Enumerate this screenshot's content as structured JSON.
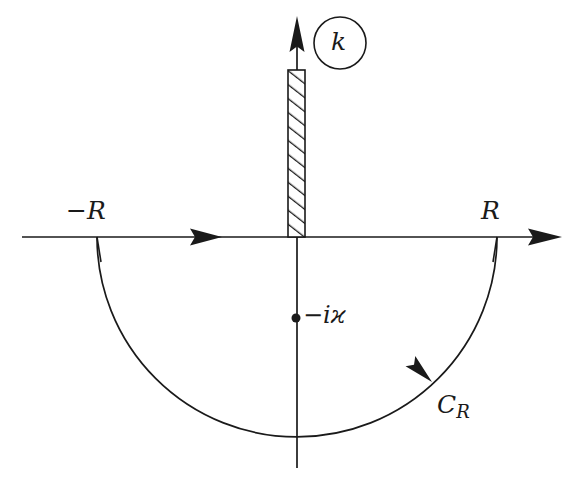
{
  "figure": {
    "type": "contour-integration-diagram",
    "width": 582,
    "height": 481,
    "background_color": "#ffffff",
    "line_color": "#1a1a1a"
  },
  "labels": {
    "variable_circle": "k",
    "left_endpoint": "−R",
    "right_endpoint": "R",
    "pole": "−iϰ",
    "arc": {
      "base": "C",
      "subscript": "R"
    }
  },
  "axes": {
    "real": {
      "name": "real-axis",
      "y": 237,
      "x_start": 22,
      "x_end": 562,
      "arrow_at_end": true,
      "mid_arrow_x": 222,
      "direction": "rightward"
    },
    "imaginary": {
      "name": "imaginary-axis",
      "x": 297,
      "y_top": 16,
      "y_bottom": 468,
      "arrow_at_top": true,
      "direction": "upward"
    },
    "origin": {
      "x": 297,
      "y": 237
    }
  },
  "branch_cut": {
    "name": "branch-cut",
    "description": "hatched vertical strip on positive imaginary axis",
    "x": 288,
    "y_top": 70,
    "width": 17,
    "height": 167,
    "hatch_direction": "forward-slash",
    "hatch_spacing": 11
  },
  "pole_marker": {
    "name": "pole-point",
    "x": 296,
    "y": 318,
    "radius": 4.5
  },
  "arc": {
    "name": "semicircular-contour",
    "center_x": 297,
    "center_y": 237,
    "radius": 200,
    "half": "lower",
    "left_x": 97,
    "right_x": 497,
    "bottom_y": 447,
    "direction_arrow": {
      "x": 432,
      "y": 382,
      "angle_deg": 224,
      "orientation": "clockwise"
    }
  },
  "ticks": [
    {
      "name": "tick-minus-R",
      "x": 97,
      "y_top": 237,
      "y_bottom": 260
    },
    {
      "name": "tick-plus-R",
      "x": 497,
      "y_top": 237,
      "y_bottom": 260
    }
  ],
  "k_circle": {
    "name": "k-circle",
    "center_x": 340,
    "center_y": 43,
    "radius": 26
  }
}
